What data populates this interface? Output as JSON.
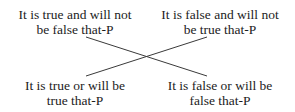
{
  "diagram": {
    "type": "square-of-opposition-cross",
    "nodes": {
      "top_left": {
        "line1": "It is true and will not",
        "line2": "be false that-P"
      },
      "top_right": {
        "line1": "It is false and will not",
        "line2": "be true that-P"
      },
      "bottom_left": {
        "line1": "It is true or will be",
        "line2": "true that-P"
      },
      "bottom_right": {
        "line1": "It is false or will be",
        "line2": "false that-P"
      }
    },
    "edges": [
      {
        "from": "top_left",
        "to": "bottom_right"
      },
      {
        "from": "top_right",
        "to": "bottom_left"
      }
    ],
    "colors": {
      "text": "#1c1c1c",
      "line": "#3a3a3a",
      "background": "#ffffff"
    }
  }
}
